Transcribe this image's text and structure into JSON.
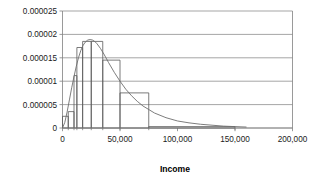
{
  "chart_data": {
    "type": "bar",
    "title": "",
    "xlabel": "Income",
    "ylabel": "",
    "xlim": [
      0,
      200000
    ],
    "ylim": [
      0,
      2.5e-05
    ],
    "grid": true,
    "legend": false,
    "x_ticks": [
      0,
      50000,
      100000,
      150000,
      200000
    ],
    "x_tick_labels": [
      "0",
      "50,000",
      "100,000",
      "150,000",
      "200,000"
    ],
    "y_ticks": [
      0,
      5e-06,
      1e-05,
      1.5e-05,
      2e-05,
      2.5e-05
    ],
    "y_tick_labels": [
      "0",
      "0.000005",
      "0.00001",
      "0.000015",
      "0.00002",
      "0.000025"
    ],
    "minor_x_ticks": [
      5000,
      10000,
      12500,
      17500,
      25000,
      35000,
      50000,
      75000,
      150000
    ],
    "histogram": {
      "name": "Income density histogram",
      "bin_edges": [
        0,
        5000,
        10000,
        12500,
        17500,
        25000,
        35000,
        50000,
        75000,
        150000
      ],
      "densities": [
        2.5e-06,
        3.5e-06,
        1.12e-05,
        1.72e-05,
        1.85e-05,
        1.85e-05,
        1.45e-05,
        7.5e-06,
        3e-07
      ]
    },
    "curve": {
      "name": "Fitted density curve",
      "x": [
        0,
        2000,
        4000,
        6000,
        8000,
        10000,
        12000,
        14000,
        16000,
        18000,
        20000,
        22000,
        24000,
        26000,
        28000,
        30000,
        33000,
        36000,
        40000,
        45000,
        50000,
        55000,
        60000,
        65000,
        70000,
        80000,
        90000,
        100000,
        110000,
        120000,
        130000,
        140000,
        150000,
        160000
      ],
      "y": [
        0.0,
        1.2e-06,
        3.4e-06,
        6e-06,
        8.6e-06,
        1.1e-05,
        1.32e-05,
        1.51e-05,
        1.66e-05,
        1.77e-05,
        1.84e-05,
        1.88e-05,
        1.89e-05,
        1.88e-05,
        1.85e-05,
        1.8e-05,
        1.7e-05,
        1.58e-05,
        1.4e-05,
        1.19e-05,
        1e-05,
        8.3e-06,
        6.9e-06,
        5.7e-06,
        4.7e-06,
        3.2e-06,
        2.2e-06,
        1.5e-06,
        1.1e-06,
        8e-07,
        6e-07,
        4e-07,
        3e-07,
        2e-07
      ]
    }
  },
  "axis_titles": {
    "x": "Income"
  },
  "caption": {
    "text": ""
  }
}
